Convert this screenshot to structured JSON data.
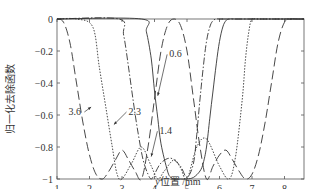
{
  "chart_data": {
    "type": "line",
    "title": "",
    "xlabel": "y位置 /mm",
    "ylabel": "归一化去除函数",
    "xlim": [
      1,
      8.6
    ],
    "ylim": [
      -1,
      0
    ],
    "xticks": [
      1,
      2,
      3,
      4,
      5,
      6,
      7,
      8
    ],
    "yticks": [
      0,
      -0.2,
      -0.4,
      -0.6,
      -0.8,
      -1
    ],
    "ytick_labels": [
      "0",
      "−0.2",
      "−0.4",
      "−0.6",
      "−0.8",
      "−1"
    ],
    "grid": false,
    "legend": "none (inline annotations)",
    "series": [
      {
        "name": "0.6",
        "style": "solid",
        "x": [
          1.0,
          3.6,
          3.75,
          3.9,
          4.0,
          4.1,
          4.2,
          4.4,
          4.5,
          4.6,
          4.8,
          5.0,
          5.2,
          5.4,
          5.5,
          5.6,
          5.7,
          5.8,
          5.9,
          6.0,
          6.1,
          6.2,
          6.3,
          6.5,
          6.7,
          6.9,
          7.1,
          7.3,
          7.5,
          8.6
        ],
        "y": [
          0,
          0,
          -0.08,
          -0.25,
          -0.45,
          -0.62,
          -0.78,
          -0.95,
          -0.99,
          -1.0,
          -1.0,
          -1.0,
          -0.99,
          -0.95,
          -0.9,
          -0.8,
          -0.62,
          -0.45,
          -0.28,
          -0.14,
          -0.05,
          -0.01,
          0,
          0,
          0,
          0,
          0,
          0,
          0,
          0
        ]
      },
      {
        "name": "1.4",
        "style": "dash-dot",
        "x": [
          1.0,
          2.9,
          3.05,
          3.2,
          3.35,
          3.5,
          3.65,
          3.8,
          3.9,
          4.0,
          4.2,
          4.5,
          4.8,
          5.0,
          5.2,
          5.3,
          5.4,
          5.5,
          5.6,
          5.7,
          5.8,
          5.9,
          6.0,
          6.1,
          6.2,
          8.6
        ],
        "y": [
          0,
          0,
          -0.1,
          -0.3,
          -0.52,
          -0.72,
          -0.88,
          -0.97,
          -1.0,
          -0.97,
          -0.9,
          -0.87,
          -0.92,
          -0.99,
          -0.9,
          -0.72,
          -0.5,
          -0.3,
          -0.14,
          -0.05,
          -0.01,
          0,
          0,
          0,
          0,
          0
        ]
      },
      {
        "name": "2.3",
        "style": "dotted",
        "x": [
          1.0,
          1.6,
          2.1,
          2.3,
          2.5,
          2.7,
          2.85,
          3.0,
          3.3,
          3.6,
          3.9,
          4.1,
          4.3,
          4.6,
          4.8,
          5.0,
          5.3,
          5.6,
          6.0,
          6.3,
          6.5,
          6.7,
          6.8,
          6.9,
          7.0,
          7.2,
          8.6
        ],
        "y": [
          0,
          0,
          -0.05,
          -0.3,
          -0.55,
          -0.8,
          -0.97,
          -1.0,
          -0.9,
          -0.8,
          -0.92,
          -1.0,
          -0.95,
          -0.88,
          -0.93,
          -1.0,
          -0.8,
          -0.75,
          -0.92,
          -1.0,
          -0.85,
          -0.5,
          -0.25,
          -0.08,
          0,
          0,
          0
        ]
      },
      {
        "name": "3.6",
        "style": "long-dash",
        "x": [
          1.0,
          1.2,
          1.4,
          1.6,
          1.8,
          2.0,
          2.2,
          2.4,
          2.6,
          2.8,
          3.0,
          3.2,
          3.4,
          3.6,
          3.8,
          4.0,
          4.2,
          4.4,
          4.6,
          4.8,
          5.0,
          5.2,
          5.4,
          5.6,
          5.8,
          6.0,
          6.2,
          6.4,
          6.6,
          6.8,
          7.0,
          7.2,
          7.4,
          7.6,
          7.8,
          8.0,
          8.2,
          8.4,
          8.6
        ],
        "y": [
          0,
          -0.02,
          -0.15,
          -0.4,
          -0.65,
          -0.85,
          -0.97,
          -1.0,
          -0.95,
          -0.88,
          -0.82,
          -0.88,
          -0.95,
          -1.0,
          -0.8,
          -0.5,
          -0.2,
          -0.04,
          0,
          -0.04,
          -0.2,
          -0.5,
          -0.8,
          -1.0,
          -0.92,
          -0.85,
          -0.82,
          -0.88,
          -0.95,
          -1.0,
          -0.97,
          -0.85,
          -0.65,
          -0.4,
          -0.15,
          -0.02,
          0,
          0,
          0
        ]
      }
    ],
    "annotations": [
      {
        "text": "0.6",
        "x": 4.45,
        "y": -0.24
      },
      {
        "text": "1.4",
        "x": 4.15,
        "y": -0.72
      },
      {
        "text": "2.3",
        "x": 3.2,
        "y": -0.6
      },
      {
        "text": "3.6",
        "x": 1.35,
        "y": -0.6
      }
    ]
  }
}
